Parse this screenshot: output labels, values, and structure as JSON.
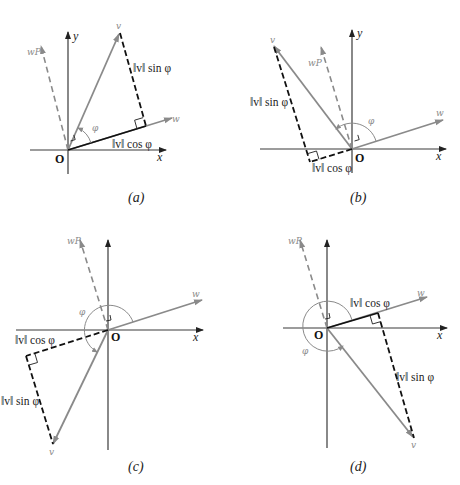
{
  "figure": {
    "panels": [
      {
        "id": "a",
        "caption": "(a)",
        "origin_label": "O",
        "x_label": "x",
        "y_label": "y",
        "v_label": "v",
        "w_label": "w",
        "wp_label": "wP",
        "phi_label": "φ",
        "sin_label": "‖v‖ sin φ",
        "cos_label": "‖v‖ cos φ"
      },
      {
        "id": "b",
        "caption": "(b)",
        "origin_label": "O",
        "x_label": "x",
        "y_label": "y",
        "v_label": "v",
        "w_label": "w",
        "wp_label": "wP",
        "phi_label": "φ",
        "sin_label": "‖v‖ sin φ",
        "cos_label": "‖v‖ cos φ"
      },
      {
        "id": "c",
        "caption": "(c)",
        "origin_label": "O",
        "x_label": "x",
        "y_label": "y",
        "v_label": "v",
        "w_label": "w",
        "wp_label": "wP",
        "phi_label": "φ",
        "sin_label": "‖v‖ sin φ",
        "cos_label": "‖v‖ cos φ"
      },
      {
        "id": "d",
        "caption": "(d)",
        "origin_label": "O",
        "x_label": "x",
        "y_label": "y",
        "v_label": "v",
        "w_label": "w",
        "wp_label": "wP",
        "phi_label": "φ",
        "sin_label": "‖v‖ sin φ",
        "cos_label": "‖v‖ cos φ"
      }
    ]
  },
  "colors": {
    "vector_gray": "#8a8a8a",
    "axis": "#3a3a3a",
    "projection": "#111111"
  }
}
